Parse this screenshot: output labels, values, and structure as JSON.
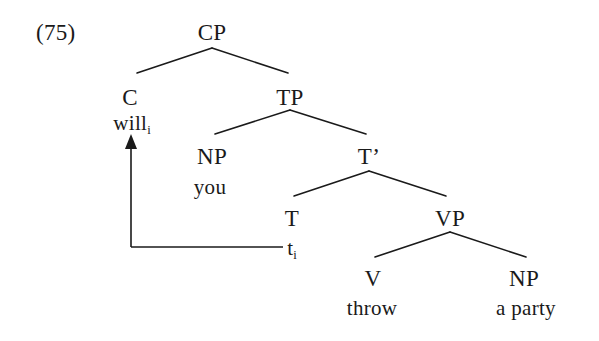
{
  "figure": {
    "example_number": "(75)",
    "kind": "syntactic-tree-diagram",
    "sentence": "will you throw a party",
    "line_color": "#1a1a1a",
    "background_color": "#ffffff"
  },
  "nodes": {
    "cp": {
      "label": "CP",
      "x": 212,
      "y": 32
    },
    "c": {
      "label": "C",
      "x": 130,
      "y": 97
    },
    "will": {
      "label": "will",
      "sub": "i",
      "x": 132,
      "y": 123
    },
    "tp": {
      "label": "TP",
      "x": 290,
      "y": 97
    },
    "np_subj": {
      "label": "NP",
      "x": 212,
      "y": 156
    },
    "you": {
      "label": "you",
      "x": 210,
      "y": 187
    },
    "tbar": {
      "label": "T’",
      "x": 369,
      "y": 156
    },
    "t": {
      "label": "T",
      "x": 292,
      "y": 218
    },
    "trace": {
      "label": "t",
      "sub": "i",
      "x": 292,
      "y": 248
    },
    "vp": {
      "label": "VP",
      "x": 450,
      "y": 218
    },
    "v": {
      "label": "V",
      "x": 373,
      "y": 278
    },
    "throw": {
      "label": "throw",
      "x": 372,
      "y": 308
    },
    "np_obj": {
      "label": "NP",
      "x": 524,
      "y": 278
    },
    "a_party": {
      "label": "a party",
      "x": 526,
      "y": 308
    }
  },
  "branches": [
    {
      "name": "cp-to-c",
      "x1": 212,
      "y1": 48,
      "x2": 137,
      "y2": 73
    },
    {
      "name": "cp-to-tp",
      "x1": 212,
      "y1": 48,
      "x2": 288,
      "y2": 73
    },
    {
      "name": "tp-to-np",
      "x1": 290,
      "y1": 110,
      "x2": 215,
      "y2": 134
    },
    {
      "name": "tp-to-tbar",
      "x1": 290,
      "y1": 110,
      "x2": 366,
      "y2": 134
    },
    {
      "name": "tbar-to-t",
      "x1": 369,
      "y1": 171,
      "x2": 294,
      "y2": 196
    },
    {
      "name": "tbar-to-vp",
      "x1": 369,
      "y1": 171,
      "x2": 446,
      "y2": 196
    },
    {
      "name": "vp-to-v",
      "x1": 450,
      "y1": 232,
      "x2": 375,
      "y2": 257
    },
    {
      "name": "vp-to-npobj",
      "x1": 450,
      "y1": 232,
      "x2": 526,
      "y2": 257
    }
  ],
  "movement_arrow": {
    "name": "head-movement-t-to-c",
    "from": "t_i",
    "to": "will_i",
    "horizontal": {
      "x1": 283,
      "y1": 247,
      "x2": 131,
      "y2": 247
    },
    "vertical": {
      "x1": 131,
      "y1": 247,
      "x2": 131,
      "y2": 140
    },
    "arrowhead": {
      "tip_x": 131,
      "tip_y": 134,
      "half_width": 6,
      "height": 15
    }
  }
}
